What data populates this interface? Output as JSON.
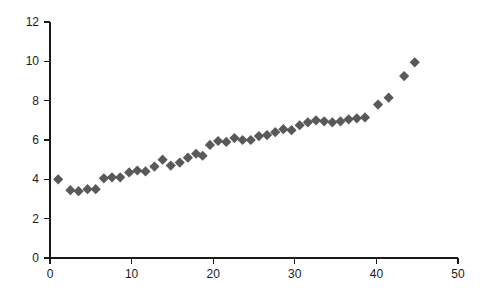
{
  "chart_data": {
    "type": "scatter",
    "title": "",
    "subtitle": "",
    "xlabel": "",
    "ylabel": "",
    "xlim": [
      0,
      50
    ],
    "ylim": [
      0,
      12
    ],
    "xticks": [
      0,
      10,
      20,
      30,
      40,
      50
    ],
    "yticks": [
      0,
      2,
      4,
      6,
      8,
      10,
      12
    ],
    "xtick_labels": [
      "0",
      "10",
      "20",
      "30",
      "40",
      "50"
    ],
    "ytick_labels": [
      "0",
      "2",
      "4",
      "6",
      "8",
      "10",
      "12"
    ],
    "grid": false,
    "legend": false,
    "legend_position": "none",
    "marker": "diamond",
    "marker_color": "#595959",
    "marker_size": 7,
    "axis_color": "#1a1a1a",
    "background_color": "#ffffff",
    "series": [
      {
        "name": "series-1",
        "points": [
          [
            1.0,
            4.0
          ],
          [
            2.5,
            3.45
          ],
          [
            3.5,
            3.4
          ],
          [
            4.6,
            3.5
          ],
          [
            5.6,
            3.5
          ],
          [
            6.6,
            4.05
          ],
          [
            7.6,
            4.1
          ],
          [
            8.6,
            4.1
          ],
          [
            9.7,
            4.35
          ],
          [
            10.7,
            4.45
          ],
          [
            11.7,
            4.4
          ],
          [
            12.8,
            4.65
          ],
          [
            13.8,
            5.0
          ],
          [
            14.8,
            4.7
          ],
          [
            15.9,
            4.85
          ],
          [
            16.9,
            5.1
          ],
          [
            17.9,
            5.3
          ],
          [
            18.7,
            5.2
          ],
          [
            19.6,
            5.75
          ],
          [
            20.6,
            5.95
          ],
          [
            21.6,
            5.9
          ],
          [
            22.6,
            6.1
          ],
          [
            23.6,
            6.0
          ],
          [
            24.6,
            6.0
          ],
          [
            25.6,
            6.2
          ],
          [
            26.6,
            6.25
          ],
          [
            27.6,
            6.4
          ],
          [
            28.6,
            6.55
          ],
          [
            29.6,
            6.5
          ],
          [
            30.6,
            6.75
          ],
          [
            31.6,
            6.9
          ],
          [
            32.6,
            7.0
          ],
          [
            33.6,
            6.95
          ],
          [
            34.6,
            6.9
          ],
          [
            35.6,
            6.95
          ],
          [
            36.6,
            7.05
          ],
          [
            37.6,
            7.1
          ],
          [
            38.6,
            7.15
          ],
          [
            40.2,
            7.8
          ],
          [
            41.5,
            8.15
          ],
          [
            43.4,
            9.25
          ],
          [
            44.7,
            9.95
          ]
        ]
      }
    ]
  }
}
